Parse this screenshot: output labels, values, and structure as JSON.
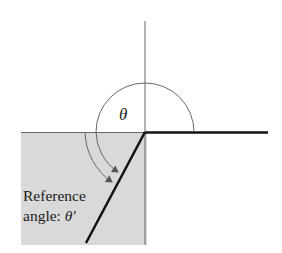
{
  "diagram": {
    "labels": {
      "theta": "θ",
      "reference_line1": "Reference",
      "reference_line2_prefix": "angle: ",
      "reference_symbol": "θ′"
    },
    "colors": {
      "shade": "#d9d9d9",
      "axis": "#555555",
      "ray": "#111111",
      "arc": "#666666"
    },
    "elements": {
      "initial_side": "positive x-axis (thick)",
      "terminal_side": "ray in quadrant III",
      "angle_theta_arc": "arc from positive x-axis counterclockwise to terminal side",
      "reference_arc": "arrow from negative x-axis to terminal side",
      "shaded_region": "quadrant III"
    }
  }
}
